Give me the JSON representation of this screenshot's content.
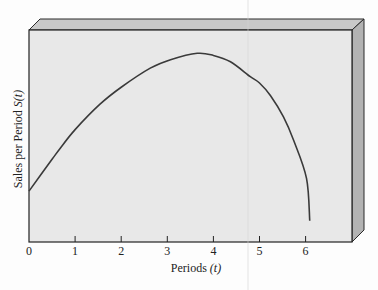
{
  "chart_data": {
    "type": "line",
    "title": "",
    "xlabel": "Periods (t)",
    "ylabel": "Sales per Period S(t)",
    "xlabel_parts": {
      "text": "Periods",
      "var": "(t)"
    },
    "ylabel_parts": {
      "text": "Sales per Period",
      "var": "S(t)"
    },
    "x_ticks": [
      0,
      1,
      2,
      3,
      4,
      5,
      6
    ],
    "xlim": [
      0,
      7
    ],
    "y_ticks": [],
    "grid": false,
    "legend": "none",
    "style": "3D box frame, gray panel",
    "series": [
      {
        "name": "S(t)",
        "x": [
          0,
          0.5,
          0.67,
          1.0,
          1.54,
          2.0,
          2.63,
          3.07,
          3.65,
          4.0,
          4.37,
          4.8,
          5.0,
          5.24,
          5.52,
          5.74,
          6.02,
          6.09
        ],
        "y_rel": [
          0.24,
          0.39,
          0.44,
          0.53,
          0.65,
          0.73,
          0.82,
          0.86,
          0.89,
          0.88,
          0.85,
          0.78,
          0.75,
          0.69,
          0.59,
          0.48,
          0.3,
          0.1
        ]
      }
    ],
    "annotations": [
      "Peak near t ≈ 3.65",
      "Curve ends near t ≈ 6.1"
    ]
  },
  "colors": {
    "panel": "#e8e8e8",
    "frame_top": "#c6c6c6",
    "frame_side": "#b3b3b3",
    "curve": "#3a3a3a",
    "axis": "#222222"
  }
}
